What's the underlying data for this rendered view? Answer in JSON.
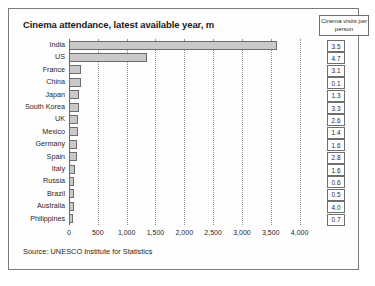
{
  "chart_data": {
    "type": "bar",
    "title": "Cinema attendance, latest available year, m",
    "orientation": "horizontal",
    "xlabel": "",
    "ylabel": "",
    "xlim": [
      0,
      4250
    ],
    "grid": true,
    "legend_position": "top-right",
    "legend_title": "Cinema visits per person",
    "xticks": [
      0,
      500,
      1000,
      1500,
      2000,
      2500,
      3000,
      3500,
      4000
    ],
    "xtick_labels": [
      "0",
      "500",
      "1,000",
      "1,500",
      "2,000",
      "2,500",
      "3,000",
      "3,500",
      "4,000"
    ],
    "categories": [
      "India",
      "US",
      "France",
      "China",
      "Japan",
      "South Korea",
      "UK",
      "Mexico",
      "Germany",
      "Spain",
      "Italy",
      "Russia",
      "Brazil",
      "Australia",
      "Philippines"
    ],
    "values": [
      3600,
      1350,
      210,
      205,
      170,
      165,
      160,
      155,
      145,
      135,
      105,
      95,
      90,
      85,
      75
    ],
    "series": [
      {
        "name": "Cinema attendance, m",
        "values": [
          3600,
          1350,
          210,
          205,
          170,
          165,
          160,
          155,
          145,
          135,
          105,
          95,
          90,
          85,
          75
        ]
      },
      {
        "name": "Cinema visits per person",
        "values": [
          3.5,
          4.7,
          3.1,
          0.1,
          1.3,
          3.3,
          2.6,
          1.4,
          1.6,
          2.8,
          1.6,
          0.6,
          0.5,
          4.0,
          0.7
        ]
      }
    ],
    "visits_per_person_labels": [
      "3.5",
      "4.7",
      "3.1",
      "0.1",
      "1.3",
      "3.3",
      "2.6",
      "1.4",
      "1.6",
      "2.8",
      "1.6",
      "0.6",
      "0.5",
      "4.0",
      "0.7"
    ],
    "source": "Source: UNESCO Institute for Statistics",
    "bar_color": "#c9c9c9",
    "bar_border_color": "#6d6d6d",
    "grid_color": "#8e8e8e",
    "axis_color": "#5d5d5d"
  }
}
